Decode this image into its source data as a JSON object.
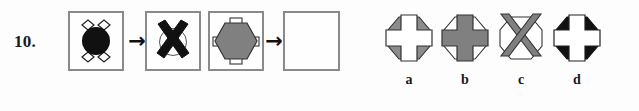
{
  "question": {
    "number_label": "10.",
    "type": "visual-analogy-matrix"
  },
  "colors": {
    "black": "#111111",
    "gray_fill": "#808080",
    "gray_fill_light": "#8c8c8c",
    "white": "#ffffff",
    "outline": "#333333",
    "box_border": "#8a8a8a",
    "page_background": "#fdfdfd",
    "text": "#1a1a1a"
  },
  "stimulus": {
    "arrow_glyph": "→",
    "panels": [
      {
        "id": "panel-1",
        "description": "black circle with four white diamonds at diagonal positions",
        "base_shape": "circle",
        "base_fill": "black",
        "overlay_shape": "four-diamonds-diagonal",
        "overlay_fill": "white"
      },
      {
        "id": "panel-2",
        "description": "thin outlined circle with a thick black X over it",
        "base_shape": "circle",
        "base_fill": "white",
        "overlay_shape": "x-cross",
        "overlay_fill": "black"
      },
      {
        "id": "panel-3",
        "description": "gray hexagon with four white rectangles at orthogonal positions",
        "base_shape": "hexagon",
        "base_fill": "gray",
        "overlay_shape": "four-rectangles-orthogonal",
        "overlay_fill": "white"
      },
      {
        "id": "panel-4",
        "description": "empty answer box",
        "base_shape": "none",
        "base_fill": "white",
        "overlay_shape": "none",
        "overlay_fill": "none"
      }
    ]
  },
  "options": [
    {
      "id": "option-a",
      "label": "a",
      "description": "gray octagonal base with a white outlined plus-cross on top",
      "base_fill": "gray",
      "overlay_shape": "plus-cross",
      "overlay_fill": "white"
    },
    {
      "id": "option-b",
      "label": "b",
      "description": "white outlined octagonal base with a gray plus-cross on top",
      "base_fill": "white",
      "overlay_shape": "plus-cross",
      "overlay_fill": "gray"
    },
    {
      "id": "option-c",
      "label": "c",
      "description": "white outlined octagonal base with a gray X-cross on top",
      "base_fill": "white",
      "overlay_shape": "x-cross",
      "overlay_fill": "gray"
    },
    {
      "id": "option-d",
      "label": "d",
      "description": "black octagonal base with a white outlined plus-cross on top",
      "base_fill": "black",
      "overlay_shape": "plus-cross",
      "overlay_fill": "white"
    }
  ]
}
